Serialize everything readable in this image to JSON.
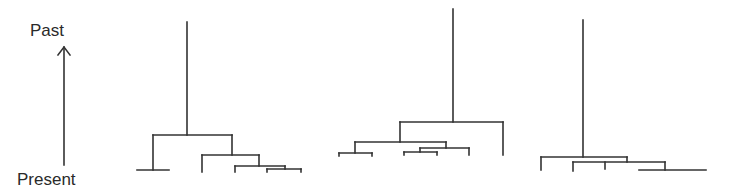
{
  "time_axis": {
    "top_label": "Past",
    "bottom_label": "Present",
    "direction": "up",
    "x": 64,
    "y_top": 47,
    "y_bottom": 165
  },
  "trees": [
    {
      "name": "tree-1",
      "segments": [
        [
          187,
          22,
          187,
          135
        ],
        [
          153,
          135,
          232,
          135
        ],
        [
          153,
          135,
          153,
          170
        ],
        [
          137,
          170,
          169,
          170
        ],
        [
          232,
          135,
          232,
          155
        ],
        [
          202,
          155,
          259,
          155
        ],
        [
          202,
          155,
          202,
          172
        ],
        [
          259,
          155,
          259,
          166
        ],
        [
          235,
          166,
          285,
          166
        ],
        [
          235,
          166,
          235,
          172
        ],
        [
          285,
          166,
          285,
          169
        ],
        [
          267,
          169,
          301,
          169
        ],
        [
          267,
          169,
          267,
          172
        ],
        [
          301,
          169,
          301,
          172
        ]
      ]
    },
    {
      "name": "tree-2",
      "segments": [
        [
          453,
          9,
          453,
          122
        ],
        [
          400,
          122,
          503,
          122
        ],
        [
          503,
          122,
          503,
          155
        ],
        [
          400,
          122,
          400,
          142
        ],
        [
          355,
          142,
          446,
          142
        ],
        [
          355,
          142,
          355,
          153
        ],
        [
          339,
          153,
          372,
          153
        ],
        [
          339,
          153,
          339,
          156
        ],
        [
          372,
          153,
          372,
          156
        ],
        [
          446,
          142,
          446,
          148
        ],
        [
          420,
          148,
          469,
          148
        ],
        [
          469,
          148,
          469,
          155
        ],
        [
          420,
          148,
          420,
          152
        ],
        [
          404,
          152,
          437,
          152
        ],
        [
          404,
          152,
          404,
          155
        ],
        [
          437,
          152,
          437,
          155
        ]
      ]
    },
    {
      "name": "tree-3",
      "segments": [
        [
          583,
          20,
          583,
          157
        ],
        [
          541,
          157,
          627,
          157
        ],
        [
          541,
          157,
          541,
          170
        ],
        [
          627,
          157,
          627,
          162
        ],
        [
          573,
          162,
          665,
          162
        ],
        [
          573,
          162,
          573,
          171
        ],
        [
          605,
          162,
          605,
          169
        ],
        [
          665,
          162,
          665,
          170
        ],
        [
          639,
          170,
          706,
          170
        ]
      ]
    }
  ]
}
